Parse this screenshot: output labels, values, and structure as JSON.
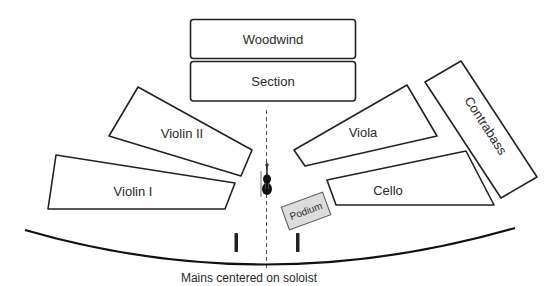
{
  "diagram": {
    "type": "orchestra-seating-plan",
    "sections": {
      "woodwind": {
        "label": "Woodwind"
      },
      "woodwind_section": {
        "label": "Section"
      },
      "violin_2": {
        "label": "Violin II"
      },
      "violin_1": {
        "label": "Violin I"
      },
      "viola": {
        "label": "Viola"
      },
      "cello": {
        "label": "Cello"
      },
      "contrabass": {
        "label": "Contrabass"
      }
    },
    "podium": {
      "label": "Podium",
      "fill": "#dcdcdc"
    },
    "soloist": {
      "icon": "violin-icon"
    },
    "center_line": {
      "style": "dashed"
    },
    "microphones": [
      {
        "name": "main-mic-left",
        "icon": "microphone-icon"
      },
      {
        "name": "main-mic-right",
        "icon": "microphone-icon"
      }
    ],
    "stage_edge": {
      "style": "curve"
    },
    "caption": "Mains centered on soloist",
    "colors": {
      "stroke": "#222222",
      "text": "#2a2a2a",
      "podium_fill": "#dcdcdc",
      "background": "#ffffff"
    }
  }
}
